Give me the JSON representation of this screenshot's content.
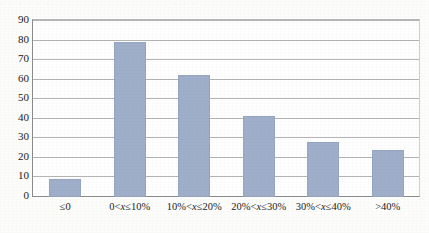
{
  "top_remnant": {
    "segment_1": "· · · · · ·",
    "segment_2": "· · ·"
  },
  "colors": {
    "bar_fill": "#9fafc9",
    "bar_border": "#94a6c2",
    "gridline": "#b4b4b4",
    "axis": "#8b8b8b",
    "text": "#1c1c1c",
    "page_background": "#fdfdfb",
    "plot_background": "#ffffff"
  },
  "chart_data": {
    "type": "bar",
    "title": "",
    "xlabel": "",
    "ylabel": "",
    "ylim": [
      0,
      90
    ],
    "ytick_step": 10,
    "yticks": [
      90,
      80,
      70,
      60,
      50,
      40,
      30,
      20,
      10,
      0
    ],
    "grid": true,
    "legend": "none",
    "categories": [
      "≤0",
      "0<x≤10%",
      "10%<x≤20%",
      "20%<x≤30%",
      "30%<x≤40%",
      ">40%"
    ],
    "category_parts": [
      {
        "pre": "≤",
        "var": "",
        "post": "0"
      },
      {
        "pre": "0<",
        "var": "x",
        "post": "≤10%"
      },
      {
        "pre": "10%<",
        "var": "x",
        "post": "≤20%"
      },
      {
        "pre": "20%<",
        "var": "x",
        "post": "≤30%"
      },
      {
        "pre": "30%<",
        "var": "x",
        "post": "≤40%"
      },
      {
        "pre": ">",
        "var": "",
        "post": "40%"
      }
    ],
    "values": [
      9,
      79,
      62,
      41,
      28,
      24
    ]
  }
}
